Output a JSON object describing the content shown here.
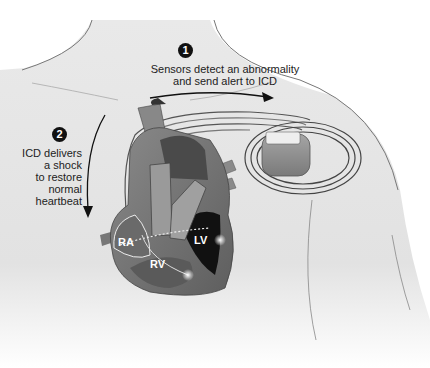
{
  "diagram": {
    "steps": [
      {
        "number": "1",
        "text_line1": "Sensors detect an abnormality",
        "text_line2": "and send alert to ICD"
      },
      {
        "number": "2",
        "text_lines": [
          "ICD delivers",
          "a shock",
          "to restore",
          "normal",
          "heartbeat"
        ]
      }
    ],
    "chambers": {
      "ra": "RA",
      "rv": "RV",
      "lv": "LV"
    },
    "colors": {
      "skin": "#e6e6e6",
      "outline": "#777777",
      "heart_dark": "#2a2a2a",
      "heart_mid": "#6f6f6f",
      "heart_light": "#9a9a9a",
      "device": "#8c8c8c",
      "badge": "#111111"
    }
  }
}
